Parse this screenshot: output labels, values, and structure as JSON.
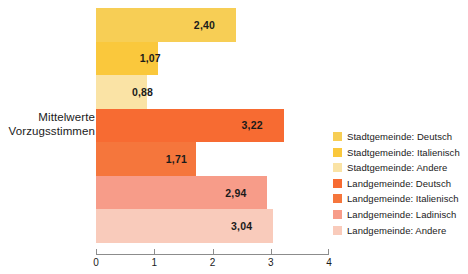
{
  "chart_data": {
    "type": "bar",
    "orientation": "horizontal",
    "title": "",
    "xlabel": "",
    "ylabel": "Mittelwerte Vorzugsstimmen",
    "category_label_lines": [
      "Mittelwerte",
      "Vorzugsstimmen"
    ],
    "xlim": [
      0,
      4
    ],
    "xticks": [
      "0",
      "1",
      "2",
      "3",
      "4"
    ],
    "grid": false,
    "legend_position": "right",
    "categories": [
      "Stadtgemeinde: Deutsch",
      "Stadtgemeinde: Italienisch",
      "Stadtgemeinde: Andere",
      "Landgemeinde: Deutsch",
      "Landgemeinde: Italienisch",
      "Landgemeinde: Ladinisch",
      "Landgemeinde: Andere"
    ],
    "values": [
      2.4,
      1.07,
      0.88,
      3.22,
      1.71,
      2.94,
      3.04
    ],
    "value_labels": [
      "2,40",
      "1,07",
      "0,88",
      "3,22",
      "1,71",
      "2,94",
      "3,04"
    ],
    "colors": [
      "#f7ce55",
      "#fac83c",
      "#fae3a5",
      "#f76b32",
      "#f5763c",
      "#f79c89",
      "#f9cbbb"
    ],
    "bars": [
      {
        "label": "Stadtgemeinde: Deutsch",
        "value": 2.4,
        "value_label": "2,40",
        "color": "#f7ce55"
      },
      {
        "label": "Stadtgemeinde: Italienisch",
        "value": 1.07,
        "value_label": "1,07",
        "color": "#fac83c"
      },
      {
        "label": "Stadtgemeinde: Andere",
        "value": 0.88,
        "value_label": "0,88",
        "color": "#fae3a5"
      },
      {
        "label": "Landgemeinde: Deutsch",
        "value": 3.22,
        "value_label": "3,22",
        "color": "#f76b32"
      },
      {
        "label": "Landgemeinde: Italienisch",
        "value": 1.71,
        "value_label": "1,71",
        "color": "#f5763c"
      },
      {
        "label": "Landgemeinde: Ladinisch",
        "value": 2.94,
        "value_label": "2,94",
        "color": "#f79c89"
      },
      {
        "label": "Landgemeinde: Andere",
        "value": 3.04,
        "value_label": "3,04",
        "color": "#f9cbbb"
      }
    ]
  },
  "axis": {
    "ticks": [
      {
        "label": "0",
        "value": 0
      },
      {
        "label": "1",
        "value": 1
      },
      {
        "label": "2",
        "value": 2
      },
      {
        "label": "3",
        "value": 3
      },
      {
        "label": "4",
        "value": 4
      }
    ],
    "line_color": "#8c8c8c"
  },
  "legend": {
    "items": [
      {
        "label": "Stadtgemeinde: Deutsch",
        "color": "#f7ce55"
      },
      {
        "label": "Stadtgemeinde: Italienisch",
        "color": "#fac83c"
      },
      {
        "label": "Stadtgemeinde: Andere",
        "color": "#fae3a5"
      },
      {
        "label": "Landgemeinde: Deutsch",
        "color": "#f76b32"
      },
      {
        "label": "Landgemeinde: Italienisch",
        "color": "#f5763c"
      },
      {
        "label": "Landgemeinde: Ladinisch",
        "color": "#f79c89"
      },
      {
        "label": "Landgemeinde: Andere",
        "color": "#f9cbbb"
      }
    ]
  }
}
